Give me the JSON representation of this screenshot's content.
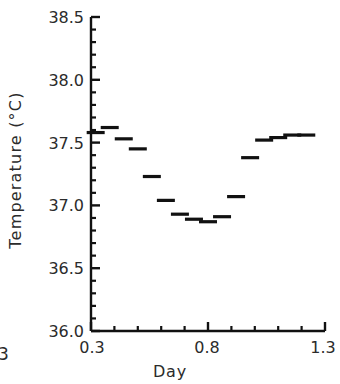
{
  "chart_data": {
    "type": "scatter",
    "title": "",
    "xlabel": "Day",
    "ylabel": "Temperature (°C)",
    "xlim": [
      0.3,
      1.3
    ],
    "ylim": [
      36.0,
      38.5
    ],
    "grid": false,
    "legend": null,
    "marker_style": "horizontal-dash",
    "y_ticks": [
      "36.0",
      "36.5",
      "37.0",
      "37.5",
      "38.0",
      "38.5"
    ],
    "y_tick_values": [
      36.0,
      36.5,
      37.0,
      37.5,
      38.0,
      38.5
    ],
    "y_minor_ticks_per_interval": 4,
    "x_ticks": [
      "0.3",
      "0.8",
      "1.3"
    ],
    "x_tick_values": [
      0.3,
      0.8,
      1.3
    ],
    "x_minor_ticks_per_interval": 4,
    "x": [
      0.32,
      0.38,
      0.44,
      0.5,
      0.56,
      0.62,
      0.68,
      0.74,
      0.8,
      0.86,
      0.92,
      0.98,
      1.04,
      1.1,
      1.16,
      1.22
    ],
    "values": [
      37.58,
      37.62,
      37.53,
      37.45,
      37.23,
      37.04,
      36.93,
      36.89,
      36.87,
      36.91,
      37.07,
      37.38,
      37.52,
      37.54,
      37.56,
      37.56
    ],
    "series": [
      {
        "name": "Temperature",
        "values": [
          37.58,
          37.62,
          37.53,
          37.45,
          37.23,
          37.04,
          36.93,
          36.89,
          36.87,
          36.91,
          37.07,
          37.38,
          37.52,
          37.54,
          37.56,
          37.56
        ]
      }
    ],
    "color": "#111111"
  },
  "axis": {
    "y_label": "Temperature (°C)",
    "x_label": "Day",
    "y_tick_labels": [
      "38.5",
      "38.0",
      "37.5",
      "37.0",
      "36.5",
      "36.0"
    ],
    "x_tick_labels": [
      "0.3",
      "0.8",
      "1.3"
    ]
  },
  "page": {
    "cropped_left_text": "3"
  }
}
